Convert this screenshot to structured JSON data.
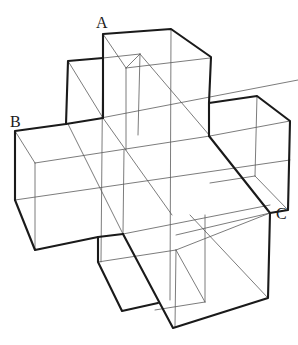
{
  "figure": {
    "labels": [
      {
        "text": "A",
        "x": 96,
        "y": 28
      },
      {
        "text": "B",
        "x": 10,
        "y": 127
      },
      {
        "text": "C",
        "x": 276,
        "y": 219
      }
    ],
    "colors": {
      "outline": "#1a1a1a",
      "inner_edges": "#5a5a5a",
      "background": "#ffffff"
    }
  }
}
